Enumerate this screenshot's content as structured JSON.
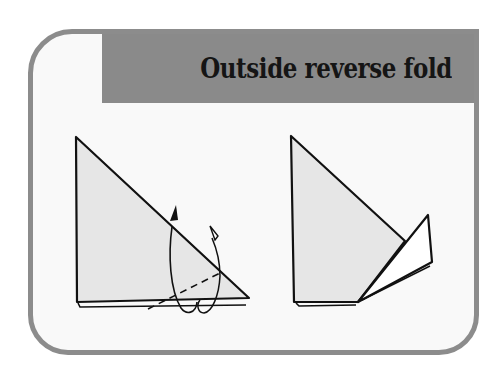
{
  "header": {
    "title": "Outside reverse fold"
  },
  "colors": {
    "frame_border": "#8c8c8c",
    "header_bg": "#8a8a8a",
    "paper_fill": "#e6e6e6",
    "flap_fill": "#ffffff",
    "line": "#111111"
  },
  "diagrams": [
    {
      "name": "before-fold",
      "description": "Triangle with dashed fold line and curved arrows indicating outside reverse fold"
    },
    {
      "name": "after-fold",
      "description": "Triangle with corner reversed outward as a white flap"
    }
  ]
}
